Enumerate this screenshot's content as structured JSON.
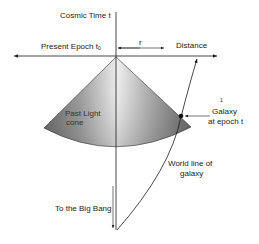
{
  "diagram": {
    "labels": {
      "cosmic_time": "Cosmic Time  t",
      "present_epoch": "Present Epoch t",
      "present_epoch_sub": "0",
      "r": "r",
      "distance": "Distance",
      "galaxy_line1": "Galaxy",
      "galaxy_line2": "at epoch t",
      "galaxy_mark": "1",
      "past_light_line1": "Past Light",
      "past_light_line2": "cone",
      "world_line1": "World line  of",
      "world_line2": "galaxy",
      "big_bang": "To the Big Bang"
    },
    "colors": {
      "line": "#1a1a1a",
      "cone_dark": "#6a6a6a",
      "cone_light": "#e8e8e8",
      "background": "#ffffff"
    }
  }
}
